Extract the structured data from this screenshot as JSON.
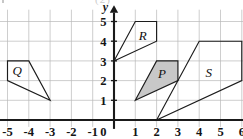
{
  "figure": {
    "kind": "coordinate-plane-diagram",
    "background_color": "#ffffff",
    "grid_color": "#b9b9b9",
    "axis_color": "#1a1a1a",
    "outline_color": "#1c1c1c"
  },
  "axes": {
    "x_name": "x",
    "y_name": "y",
    "origin_label": "0",
    "x_tick_labels": [
      "-5",
      "-4",
      "-3",
      "-2",
      "-1",
      "1",
      "2",
      "3",
      "4",
      "5",
      "6"
    ],
    "y_tick_labels": [
      "1",
      "2",
      "3",
      "4",
      "5"
    ]
  },
  "top_artifact": {
    "text": "(2)"
  },
  "chart_data": {
    "type": "scatter",
    "title": "",
    "xlabel": "x",
    "ylabel": "y",
    "xlim": [
      -5.6,
      6.6
    ],
    "ylim": [
      -0.35,
      5.6
    ],
    "xticks": [
      -5,
      -4,
      -3,
      -2,
      -1,
      0,
      1,
      2,
      3,
      4,
      5,
      6
    ],
    "yticks": [
      0,
      1,
      2,
      3,
      4,
      5
    ],
    "grid": true,
    "legend": "none",
    "shapes": [
      {
        "label": "Q",
        "fill": "none",
        "fill_color": "",
        "label_x": -4.55,
        "label_y": 2.5,
        "vertices": [
          [
            -5,
            3
          ],
          [
            -4,
            3
          ],
          [
            -3,
            1
          ],
          [
            -5,
            2
          ]
        ]
      },
      {
        "label": "R",
        "fill": "none",
        "fill_color": "",
        "label_x": 1.35,
        "label_y": 4.3,
        "vertices": [
          [
            0,
            3
          ],
          [
            1,
            5
          ],
          [
            2,
            5
          ],
          [
            2,
            4
          ]
        ]
      },
      {
        "label": "P",
        "fill": "solid",
        "fill_color": "#c8c8c8",
        "label_x": 2.25,
        "label_y": 2.35,
        "vertices": [
          [
            1,
            1
          ],
          [
            2,
            3
          ],
          [
            3,
            3
          ],
          [
            3,
            2
          ]
        ]
      },
      {
        "label": "S",
        "fill": "none",
        "fill_color": "",
        "label_x": 4.45,
        "label_y": 2.4,
        "vertices": [
          [
            2,
            0
          ],
          [
            4,
            4
          ],
          [
            6,
            4
          ],
          [
            6,
            2
          ]
        ]
      }
    ]
  }
}
